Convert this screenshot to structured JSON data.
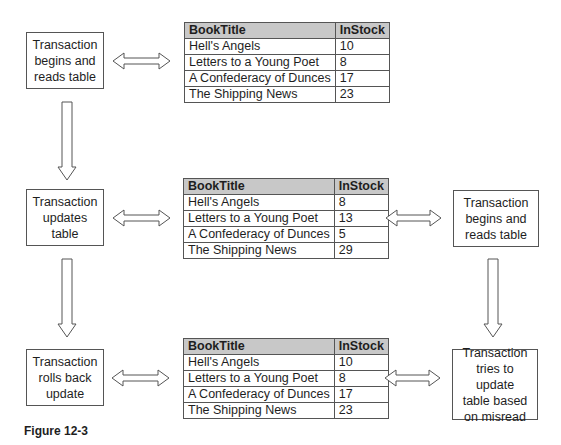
{
  "figure": {
    "caption": "Figure 12-3"
  },
  "left_boxes": [
    {
      "lines": [
        "Transaction",
        "begins and",
        "reads table"
      ]
    },
    {
      "lines": [
        "Transaction",
        "updates",
        "table"
      ]
    },
    {
      "lines": [
        "Transaction",
        "rolls back",
        "update"
      ]
    }
  ],
  "right_boxes": [
    {
      "lines": [
        "Transaction",
        "begins and",
        "reads table"
      ]
    },
    {
      "lines": [
        "Transaction",
        "tries to update",
        "table based",
        "on misread"
      ]
    }
  ],
  "tables": [
    {
      "headers": [
        "BookTitle",
        "InStock"
      ],
      "rows": [
        [
          "Hell's Angels",
          "10"
        ],
        [
          "Letters to a Young Poet",
          "8"
        ],
        [
          "A Confederacy of Dunces",
          "17"
        ],
        [
          "The Shipping News",
          "23"
        ]
      ]
    },
    {
      "headers": [
        "BookTitle",
        "InStock"
      ],
      "rows": [
        [
          "Hell's Angels",
          "8"
        ],
        [
          "Letters to a Young Poet",
          "13"
        ],
        [
          "A Confederacy of Dunces",
          "5"
        ],
        [
          "The Shipping News",
          "29"
        ]
      ]
    },
    {
      "headers": [
        "BookTitle",
        "InStock"
      ],
      "rows": [
        [
          "Hell's Angels",
          "10"
        ],
        [
          "Letters to a Young Poet",
          "8"
        ],
        [
          "A Confederacy of Dunces",
          "17"
        ],
        [
          "The Shipping News",
          "23"
        ]
      ]
    }
  ],
  "colors": {
    "header_bg": "#c8c8c8",
    "border": "#555555",
    "arrow_stroke": "#555555"
  }
}
